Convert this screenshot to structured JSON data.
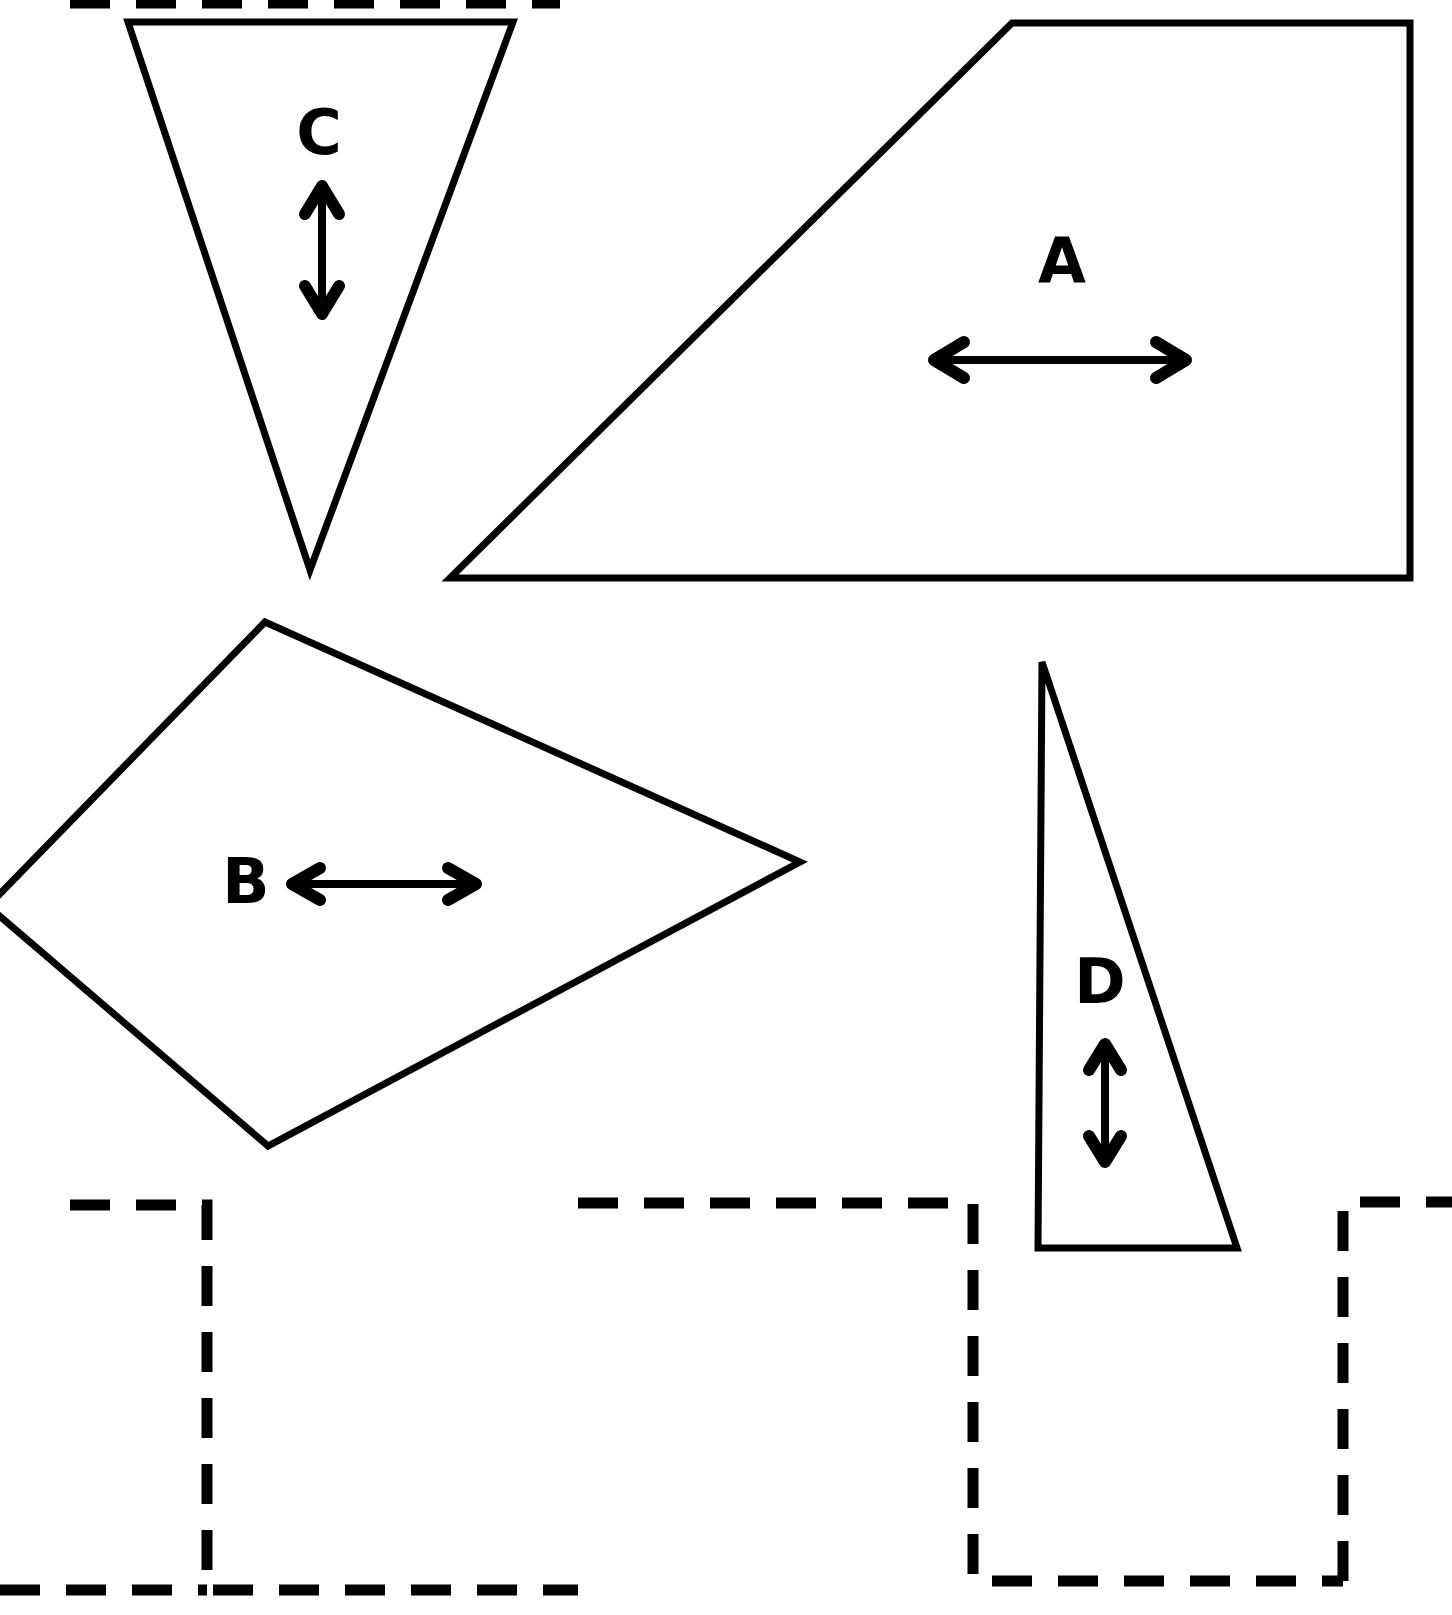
{
  "figure": {
    "background_color": "#ffffff",
    "stroke_color": "#000000",
    "canvas": {
      "width": 1452,
      "height": 1615
    }
  },
  "shapes": [
    {
      "id": "shape-a",
      "label": "A",
      "kind": "trapezoid",
      "label_position": {
        "x": 1062,
        "y": 265
      },
      "points": "1012,23 1410,23 1410,578 450,578",
      "arrow": {
        "orientation": "horizontal",
        "double_headed": true,
        "x1": 930,
        "y1": 360,
        "x2": 1190,
        "y2": 360
      }
    },
    {
      "id": "shape-b",
      "label": "B",
      "kind": "kite-quadrilateral",
      "label_position": {
        "x": 246,
        "y": 886
      },
      "points": "265,622 800,862 268,1146 -12,906",
      "arrow": {
        "orientation": "horizontal",
        "double_headed": true,
        "x1": 292,
        "y1": 884,
        "x2": 478,
        "y2": 884
      }
    },
    {
      "id": "shape-c",
      "label": "C",
      "kind": "inverted-triangle",
      "label_position": {
        "x": 319,
        "y": 137
      },
      "points": "128,22 513,22 310,570",
      "arrow": {
        "orientation": "vertical",
        "double_headed": true,
        "x1": 322,
        "y1": 183,
        "x2": 322,
        "y2": 313
      }
    },
    {
      "id": "shape-d",
      "label": "D",
      "kind": "thin-right-triangle",
      "label_position": {
        "x": 1100,
        "y": 986
      },
      "points": "1042,662 1237,1248 1038,1248",
      "arrow": {
        "orientation": "vertical",
        "double_headed": true,
        "x1": 1105,
        "y1": 1042,
        "x2": 1105,
        "y2": 1162
      }
    }
  ],
  "dashed_targets": [
    {
      "id": "dashed-target-top-left-cut",
      "note": "partial dashed edge cropped at the top of the page",
      "path": "M 70 3 L 560 3"
    },
    {
      "id": "dashed-target-1",
      "path": "M 70 1205 L 207 1205 L 207 1590 L 570 1590"
    },
    {
      "id": "dashed-target-2",
      "path": "M 578 1203 L 973 1203 L 973 1581 L 1343 1581"
    },
    {
      "id": "dashed-target-3",
      "path": "M 1343 1581 L 1343 1202 L 1452 1202"
    },
    {
      "id": "dashed-target-4-left-stub",
      "path": "M 0 1590 L 207 1590"
    },
    {
      "id": "dashed-target-5-right-stub",
      "path": "M 570 1590 L 578 1590"
    }
  ],
  "labels": {
    "a": "A",
    "b": "B",
    "c": "C",
    "d": "D"
  }
}
